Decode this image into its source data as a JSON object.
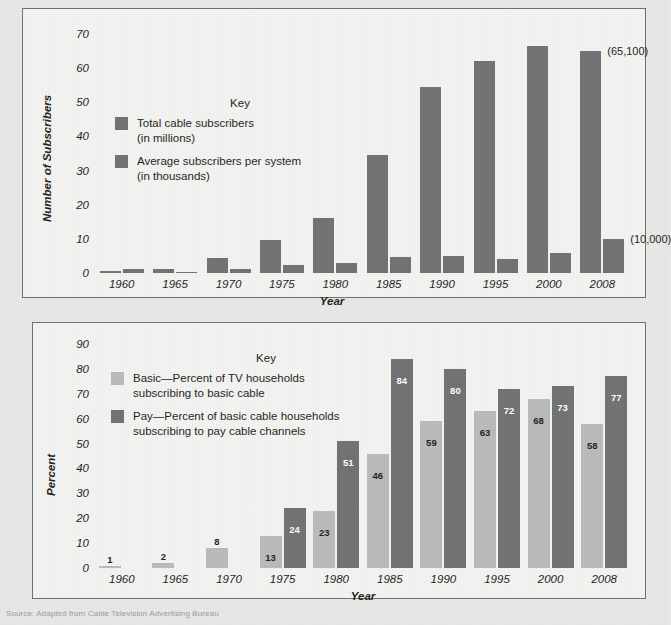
{
  "page": {
    "background_color": "#e8e8e6",
    "source_note": "Source: Adapted from Cable Television Advertising Bureau"
  },
  "colors": {
    "dark_gray_bar": "#6f7173",
    "light_gray_bar": "#b9bbbb",
    "panel_background": "#f3f3f1",
    "panel_border": "#6e6f71",
    "text": "#231f20"
  },
  "chart_data": [
    {
      "id": "cable-subscribers",
      "type": "bar",
      "title": "",
      "xlabel": "Year",
      "ylabel": "Number of Subscribers",
      "ylim": [
        0,
        72
      ],
      "yticks": [
        0,
        10,
        20,
        30,
        40,
        50,
        60,
        70
      ],
      "grid": false,
      "legend_title": "Key",
      "legend_position": "inside-upper-left",
      "categories": [
        "1960",
        "1965",
        "1970",
        "1975",
        "1980",
        "1985",
        "1990",
        "1995",
        "2000",
        "2008"
      ],
      "series": [
        {
          "name": "Total cable subscribers",
          "unit": "(in millions)",
          "color": "#6f7173",
          "values": [
            0.65,
            1.3,
            4.5,
            9.8,
            16,
            34.5,
            54.5,
            62,
            66.5,
            65.1
          ]
        },
        {
          "name": "Average subscribers per system",
          "unit": "(in thousands)",
          "color": "#6f7173",
          "values": [
            1.1,
            0.4,
            1.3,
            2.3,
            3.0,
            4.7,
            5.0,
            4.2,
            5.8,
            10.0
          ]
        }
      ],
      "annotations": [
        {
          "text": "(65,100)",
          "series": "Total cable subscribers",
          "category": "2008"
        },
        {
          "text": "(10,000)",
          "series": "Average subscribers per system",
          "category": "2008"
        }
      ]
    },
    {
      "id": "basic-vs-pay-cable",
      "type": "bar",
      "title": "",
      "xlabel": "Year",
      "ylabel": "Percent",
      "ylim": [
        0,
        92
      ],
      "yticks": [
        0,
        10,
        20,
        30,
        40,
        50,
        60,
        70,
        80,
        90
      ],
      "grid": false,
      "legend_title": "Key",
      "legend_position": "inside-upper-left",
      "categories": [
        "1960",
        "1965",
        "1970",
        "1975",
        "1980",
        "1985",
        "1990",
        "1995",
        "2000",
        "2008"
      ],
      "series": [
        {
          "name": "Basic—Percent of TV households subscribing to basic cable",
          "short_name": "Basic",
          "color": "#b9bbbb",
          "values": [
            1,
            2,
            8,
            13,
            23,
            46,
            59,
            63,
            68,
            58
          ],
          "labels": [
            "1",
            "2",
            "8",
            "13",
            "23",
            "46",
            "59",
            "63",
            "68",
            "58"
          ],
          "label_color_inside": "#231f20"
        },
        {
          "name": "Pay—Percent of basic cable households subscribing to pay cable channels",
          "short_name": "Pay",
          "color": "#6f7173",
          "values": [
            0,
            0,
            0,
            24,
            51,
            84,
            80,
            72,
            73,
            77
          ],
          "labels": [
            "",
            "",
            "",
            "24",
            "51",
            "84",
            "80",
            "72",
            "73",
            "77"
          ],
          "label_color_inside": "#ffffff"
        }
      ]
    }
  ],
  "legends": {
    "top": {
      "title": "Key",
      "items": [
        {
          "line1": "Total cable subscribers",
          "line2": "(in millions)",
          "color": "#6f7173"
        },
        {
          "line1": "Average subscribers per system",
          "line2": "(in thousands)",
          "color": "#6f7173"
        }
      ]
    },
    "bottom": {
      "title": "Key",
      "items": [
        {
          "line1": "Basic—Percent of TV households",
          "line2": "subscribing to basic cable",
          "color": "#b9bbbb"
        },
        {
          "line1": "Pay—Percent of basic cable households",
          "line2": "subscribing to pay cable channels",
          "color": "#6f7173"
        }
      ]
    }
  }
}
